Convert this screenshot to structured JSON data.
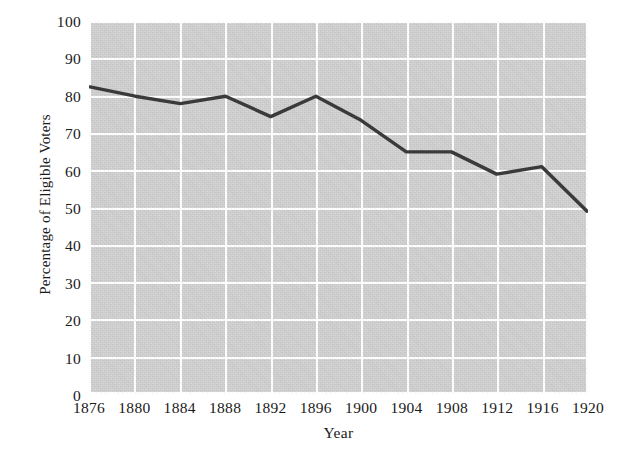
{
  "chart_data": {
    "type": "line",
    "title": "",
    "subtitle": "",
    "xlabel": "Year",
    "ylabel": "Percentage of Eligible Voters",
    "x": [
      1876,
      1880,
      1884,
      1888,
      1892,
      1896,
      1900,
      1904,
      1908,
      1912,
      1916,
      1920
    ],
    "categories": [
      "1876",
      "1880",
      "1884",
      "1888",
      "1892",
      "1896",
      "1900",
      "1904",
      "1908",
      "1912",
      "1916",
      "1920"
    ],
    "values": [
      82.5,
      80,
      78,
      80,
      74.5,
      80,
      73.5,
      65,
      65,
      59,
      61,
      49
    ],
    "series": [
      {
        "name": "Voter Turnout",
        "values": [
          82.5,
          80,
          78,
          80,
          74.5,
          80,
          73.5,
          65,
          65,
          59,
          61,
          49
        ]
      }
    ],
    "xlim": [
      1876,
      1920
    ],
    "ylim": [
      0,
      100
    ],
    "y_ticks": [
      0,
      10,
      20,
      30,
      40,
      50,
      60,
      70,
      80,
      90,
      100
    ],
    "y_tick_labels": [
      "0",
      "10",
      "20",
      "30",
      "40",
      "50",
      "60",
      "70",
      "80",
      "90",
      "100"
    ],
    "x_ticks": [
      1876,
      1880,
      1884,
      1888,
      1892,
      1896,
      1900,
      1904,
      1908,
      1912,
      1916,
      1920
    ],
    "x_tick_labels": [
      "1876",
      "1880",
      "1884",
      "1888",
      "1892",
      "1896",
      "1900",
      "1904",
      "1908",
      "1912",
      "1916",
      "1920"
    ],
    "grid": true,
    "legend": false,
    "legend_position": "none",
    "annotations": [],
    "colors": {
      "line": "#3a3a3a",
      "plot_background": "#c9c9c9",
      "gridline": "#ffffff",
      "figure_background": "#ffffff",
      "text": "#1a1a1a"
    }
  }
}
